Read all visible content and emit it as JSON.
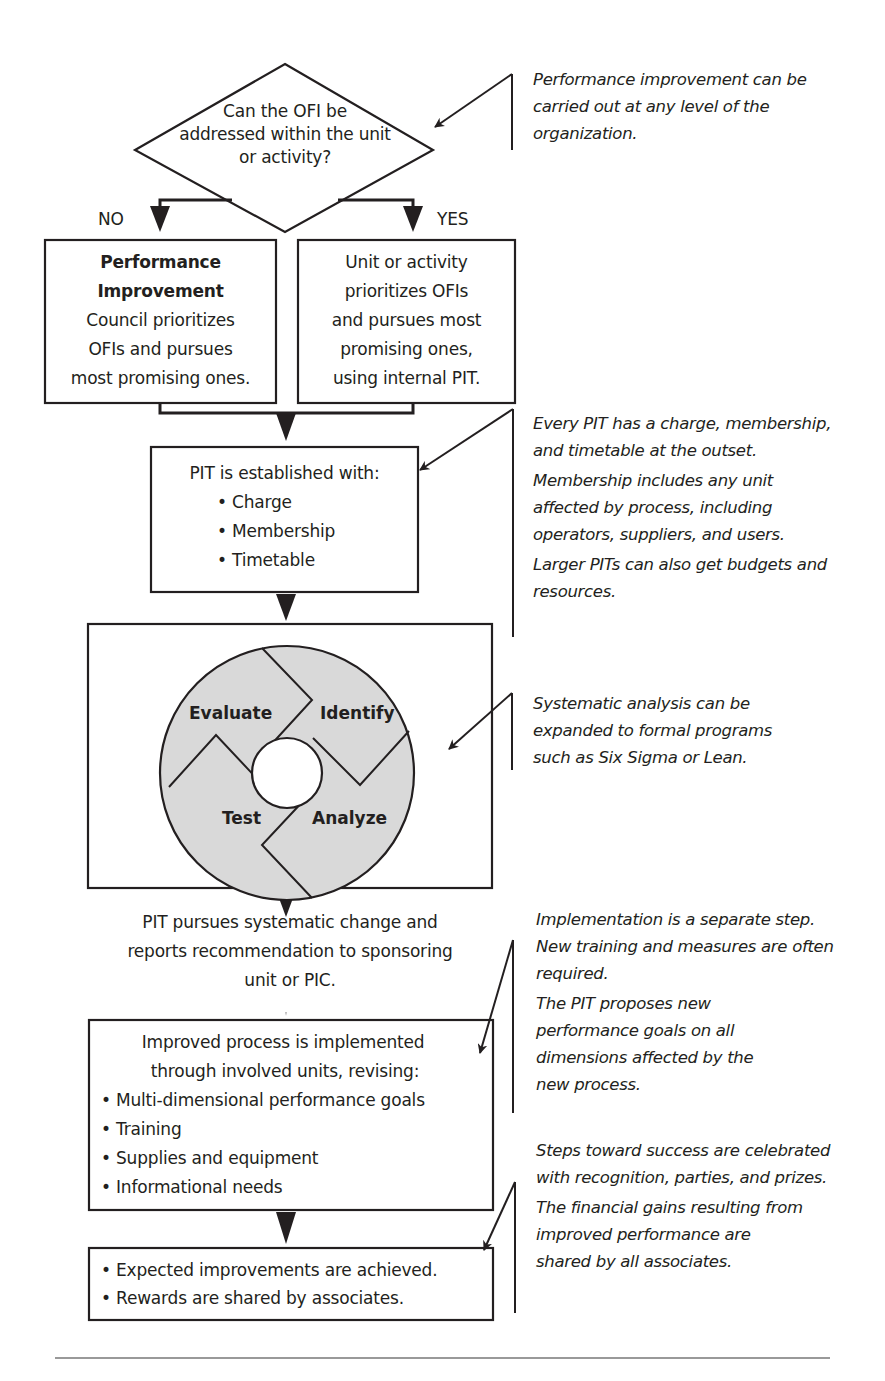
{
  "flowchart": {
    "decision": {
      "lines": [
        "Can the OFI be",
        "addressed within the unit",
        "or activity?"
      ],
      "no_label": "NO",
      "yes_label": "YES"
    },
    "no_box": {
      "title_lines": [
        "Performance",
        "Improvement"
      ],
      "body_lines": [
        "Council prioritizes",
        "OFIs and pursues",
        "most promising ones."
      ]
    },
    "yes_box": {
      "lines": [
        "Unit or activity",
        "prioritizes OFIs",
        "and pursues most",
        "promising ones,",
        "using internal PIT."
      ]
    },
    "pit_box": {
      "heading": "PIT is established with:",
      "items": [
        "• Charge",
        "• Membership",
        "• Timetable"
      ]
    },
    "cycle": {
      "segments": [
        "Evaluate",
        "Identify",
        "Analyze",
        "Test"
      ],
      "fill_color": "#d9d9d9"
    },
    "pursue_box": {
      "lines": [
        "PIT pursues systematic change and",
        "reports recommendation to sponsoring",
        "unit or PIC."
      ]
    },
    "implement_box": {
      "heading_lines": [
        "Improved process is implemented",
        "through involved units, revising:"
      ],
      "items": [
        "• Multi-dimensional performance goals",
        "• Training",
        "• Supplies and equipment",
        "• Informational needs"
      ]
    },
    "result_box": {
      "items": [
        "• Expected improvements are achieved.",
        "• Rewards are shared by associates."
      ]
    }
  },
  "notes": [
    {
      "paragraphs": [
        "Performance improvement can be carried out at any level of the organization."
      ]
    },
    {
      "paragraphs": [
        "Every PIT has a charge, membership, and timetable at the outset.",
        "Membership includes any unit affected by process, including operators, suppliers, and users.",
        "Larger PITs can also get budgets and resources."
      ]
    },
    {
      "paragraphs": [
        "Systematic analysis can be expanded to formal programs such as Six Sigma or Lean."
      ]
    },
    {
      "paragraphs": [
        "Implementation is a separate step. New training and measures are often required.",
        "The PIT proposes new performance goals on all dimensions affected by the new process."
      ]
    },
    {
      "paragraphs": [
        "Steps toward success are celebrated with recognition, parties, and prizes.",
        "The financial gains resulting from improved performance are shared by all associates."
      ]
    }
  ]
}
